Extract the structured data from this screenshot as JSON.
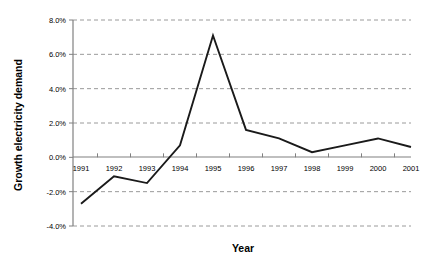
{
  "chart_data": {
    "type": "line",
    "title": "",
    "xlabel": "Year",
    "ylabel": "Growth electricity demand",
    "categories": [
      "1991",
      "1992",
      "1993",
      "1994",
      "1995",
      "1996",
      "1997",
      "1998",
      "1999",
      "2000",
      "2001"
    ],
    "values": [
      -2.7,
      -1.1,
      -1.5,
      0.7,
      7.1,
      1.6,
      1.1,
      0.3,
      0.7,
      1.1,
      0.6
    ],
    "series": [
      {
        "name": "Growth electricity demand",
        "values": [
          -2.7,
          -1.1,
          -1.5,
          0.7,
          7.1,
          1.6,
          1.1,
          0.3,
          0.7,
          1.1,
          0.6
        ]
      }
    ],
    "ylim": [
      -4.0,
      8.0
    ],
    "y_ticks": [
      8.0,
      6.0,
      4.0,
      2.0,
      0.0,
      -2.0,
      -4.0
    ],
    "y_tick_labels": [
      "8.0%",
      "6.0%",
      "4.0%",
      "2.0%",
      "0.0%",
      "-2.0%",
      "-4.0%"
    ],
    "grid": true,
    "grid_orientation": "horizontal",
    "legend": false,
    "legend_position": "none",
    "line_color": "#1a1a1a",
    "grid_color": "#9a9a9a",
    "axis_color": "#808080",
    "background_color": "#ffffff"
  },
  "footer": {
    "text": ""
  }
}
